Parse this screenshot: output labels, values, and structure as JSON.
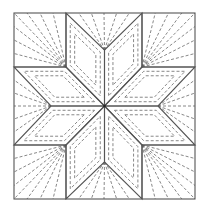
{
  "diagram": {
    "colors": {
      "background": "#ffffff",
      "seam": "#555555",
      "quilting": "#6a6a6a",
      "center_dot": "#222222"
    },
    "block": {
      "left": 14,
      "top": 13,
      "right": 195,
      "bottom": 199
    },
    "center": [
      104.5,
      106
    ],
    "grid": {
      "x1": 66,
      "x2": 142,
      "y1": 67,
      "y2": 145
    },
    "star_points": {
      "top": [
        104.5,
        50
      ],
      "bottom": [
        104.5,
        162
      ],
      "left": [
        51,
        106
      ],
      "right": [
        158,
        106
      ]
    },
    "components": [
      "8 diamond star points",
      "4 corner squares with radiating quilting lines",
      "4 side triangles with radiating quilting lines",
      "nested dashed diamond outlines"
    ]
  }
}
